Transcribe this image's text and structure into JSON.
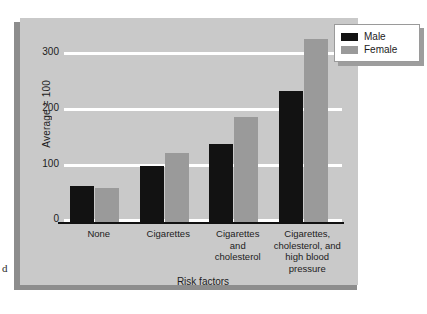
{
  "margin_glyph": "d",
  "colors": {
    "panel_background": "#c9c9c9",
    "male_bar": "#121212",
    "female_bar": "#9a9a9a",
    "gridline": "#ffffff",
    "axis": "#111111",
    "legend_background": "#ffffff",
    "legend_border": "#9a9a9a",
    "text": "#1c1c1c"
  },
  "legend": {
    "position": "top-right",
    "entries": [
      {
        "label": "Male",
        "color": "#121212",
        "swatch": "male-swatch"
      },
      {
        "label": "Female",
        "color": "#9a9a9a",
        "swatch": "female-swatch"
      }
    ]
  },
  "axes": {
    "y_title": "Average = 100",
    "y_ticks": [
      "0",
      "100",
      "200",
      "300"
    ],
    "x_title": "Risk factors"
  },
  "chart_data": {
    "type": "bar",
    "title": "",
    "subtitle": "",
    "xlabel": "Risk factors",
    "ylabel": "Average = 100",
    "ylim": [
      0,
      300
    ],
    "yticks": [
      0,
      100,
      200,
      300
    ],
    "grid": true,
    "legend_position": "top-right",
    "categories": [
      "None",
      "Cigarettes",
      "Cigarettes and cholesterol",
      "Cigarettes, cholesterol, and high blood pressure"
    ],
    "category_lines": [
      [
        "None"
      ],
      [
        "Cigarettes"
      ],
      [
        "Cigarettes",
        "and",
        "cholesterol"
      ],
      [
        "Cigarettes,",
        "cholesterol, and",
        "high blood",
        "pressure"
      ]
    ],
    "series": [
      {
        "name": "Male",
        "color": "#121212",
        "values": [
          55,
          85,
          120,
          200
        ]
      },
      {
        "name": "Female",
        "color": "#9a9a9a",
        "values": [
          52,
          105,
          160,
          280
        ]
      }
    ]
  }
}
